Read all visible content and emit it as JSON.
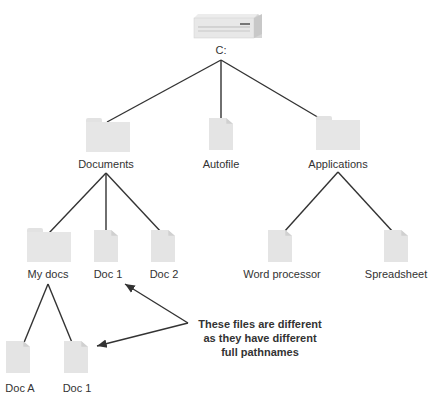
{
  "diagram": {
    "root": {
      "label": "C:",
      "icon": "hard-drive-icon"
    },
    "level1": [
      {
        "label": "Documents",
        "icon": "folder-icon"
      },
      {
        "label": "Autofile",
        "icon": "document-icon"
      },
      {
        "label": "Applications",
        "icon": "folder-icon"
      }
    ],
    "documents_children": [
      {
        "label": "My docs",
        "icon": "folder-icon"
      },
      {
        "label": "Doc 1",
        "icon": "document-icon"
      },
      {
        "label": "Doc 2",
        "icon": "document-icon"
      }
    ],
    "applications_children": [
      {
        "label": "Word processor",
        "icon": "document-icon"
      },
      {
        "label": "Spreadsheet",
        "icon": "document-icon"
      }
    ],
    "mydocs_children": [
      {
        "label": "Doc A",
        "icon": "document-icon"
      },
      {
        "label": "Doc 1",
        "icon": "document-icon"
      }
    ],
    "annotation": {
      "line1": "These files are different",
      "line2": "as they have different",
      "line3": "full pathnames"
    },
    "colors": {
      "line": "#333333",
      "icon_fill": "#e4e4e4",
      "text": "#333333"
    }
  }
}
